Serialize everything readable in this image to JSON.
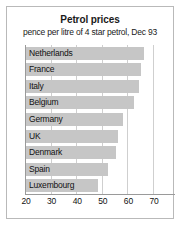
{
  "chart_data": {
    "type": "bar",
    "orientation": "horizontal",
    "title": "Petrol prices",
    "subtitle": "pence per litre of 4 star petrol, Dec 93",
    "xlabel": "",
    "ylabel": "",
    "xlim": [
      20,
      70
    ],
    "xticks": [
      20,
      30,
      40,
      50,
      60,
      70
    ],
    "grid": true,
    "legend": false,
    "bar_color": "#c6c6c6",
    "categories": [
      "Netherlands",
      "France",
      "Italy",
      "Belgium",
      "Germany",
      "UK",
      "Denmark",
      "Spain",
      "Luxembourg"
    ],
    "values": [
      66,
      65,
      64,
      62,
      58,
      56,
      55,
      52,
      48
    ],
    "series": [
      {
        "name": "Petrol price (pence per litre)",
        "values": [
          66,
          65,
          64,
          62,
          58,
          56,
          55,
          52,
          48
        ]
      }
    ]
  }
}
